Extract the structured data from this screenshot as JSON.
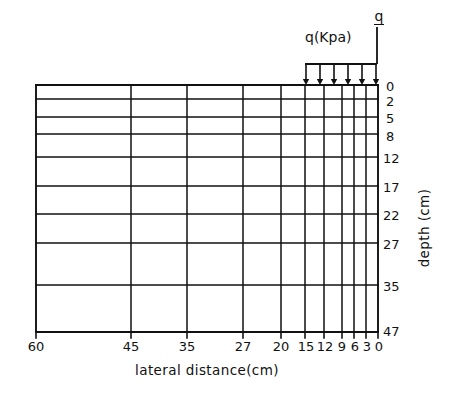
{
  "figure": {
    "background_color": "#ffffff",
    "line_color": "#111111"
  },
  "axes": {
    "x_title": "lateral distance(cm)",
    "y_title": "depth (cm)",
    "x_tick_labels": [
      "60",
      "45",
      "35",
      "27",
      "20",
      "15",
      "12",
      "9",
      "6",
      "3",
      "0"
    ],
    "y_tick_labels": [
      "0",
      "2",
      "5",
      "8",
      "12",
      "17",
      "22",
      "27",
      "35",
      "47"
    ]
  },
  "load": {
    "label": "q(Kpa)",
    "symbol": "q",
    "arrow_count": 6,
    "arrow_direction": "down"
  },
  "chart_data": {
    "type": "diagram-mesh",
    "xlabel": "lateral distance(cm)",
    "ylabel": "depth (cm)",
    "grid": true,
    "legend": "none",
    "x_orientation": "right-to-left-decreasing",
    "y_orientation": "top-to-bottom-increasing",
    "xlim": [
      60,
      0
    ],
    "ylim": [
      0,
      47
    ],
    "vertical_gridlines_cm": [
      60,
      45,
      35,
      27,
      20,
      15,
      12,
      9,
      6,
      3,
      0
    ],
    "horizontal_gridlines_cm": [
      0,
      2,
      5,
      8,
      12,
      17,
      22,
      27,
      35,
      47
    ],
    "vertical_gridlines_px_x": [
      36,
      131,
      187,
      243,
      281,
      305,
      324,
      342,
      354,
      366,
      378
    ],
    "horizontal_gridlines_px_y": [
      85,
      99,
      117,
      134,
      157,
      186,
      214,
      243,
      285,
      332
    ],
    "columns_count": 10,
    "rows_count": 9,
    "plot_box_px": {
      "left": 36,
      "top": 85,
      "right": 378,
      "bottom": 332
    },
    "load": {
      "label": "q(Kpa)",
      "symbol": "q",
      "applied_from_cm": 15,
      "applied_to_cm": 0,
      "arrow_count": 6,
      "distribution": "uniform",
      "arrow_x_px": [
        306,
        320,
        334,
        348,
        362,
        376
      ],
      "arrow_top_px": 64,
      "arrow_tip_px": 85,
      "beam_y_px": 64,
      "beam_left_px": 305,
      "beam_right_px": 377,
      "centerline_x_px": 377,
      "centerline_top_px": 27
    }
  }
}
